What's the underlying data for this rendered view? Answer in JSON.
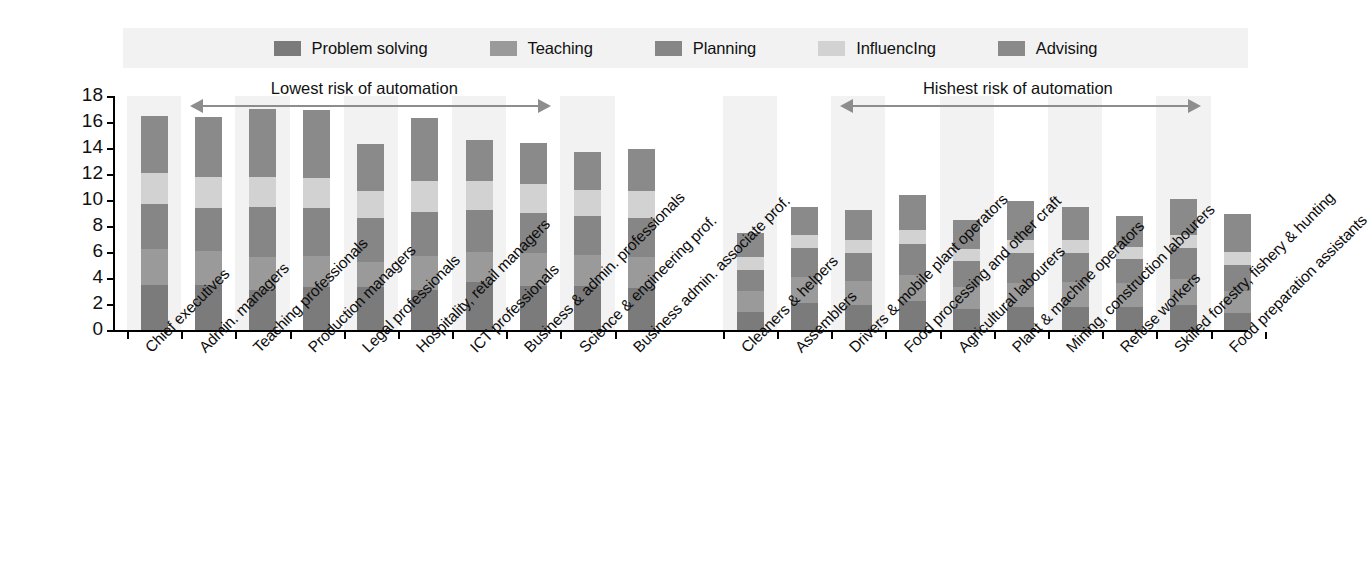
{
  "legend": {
    "items": [
      {
        "label": "Problem solving",
        "color": "#7b7b7b",
        "icon": "legend-swatch-icon"
      },
      {
        "label": "Teaching",
        "color": "#9a9a9a",
        "icon": "legend-swatch-icon"
      },
      {
        "label": "Planning",
        "color": "#868686",
        "icon": "legend-swatch-icon"
      },
      {
        "label": "InfluencIng",
        "color": "#d2d2d2",
        "icon": "legend-swatch-icon"
      },
      {
        "label": "Advising",
        "color": "#8a8a8a",
        "icon": "legend-swatch-icon"
      }
    ]
  },
  "annotations": {
    "left": {
      "text": "Lowest risk of automation"
    },
    "right": {
      "text": "Hishest risk of automation"
    }
  },
  "chart_data": {
    "type": "bar",
    "stacked": true,
    "title": "",
    "xlabel": "",
    "ylabel": "",
    "ylim": [
      0,
      18
    ],
    "ytick_labels": [
      "0",
      "2",
      "4",
      "6",
      "8",
      "10",
      "12",
      "14",
      "16",
      "18"
    ],
    "ytick_values": [
      0,
      2,
      4,
      6,
      8,
      10,
      12,
      14,
      16,
      18
    ],
    "grid": false,
    "legend_position": "top",
    "series": [
      {
        "name": "Problem solving",
        "color": "#7b7b7b",
        "values": [
          3.5,
          3.5,
          3.1,
          3.3,
          3.3,
          3.1,
          3.7,
          3.4,
          3.4,
          3.2,
          1.4,
          2.1,
          1.9,
          2.2,
          1.6,
          1.8,
          1.8,
          1.8,
          1.9,
          1.3
        ]
      },
      {
        "name": "Teaching",
        "color": "#9a9a9a",
        "values": [
          2.7,
          2.6,
          2.5,
          2.4,
          1.9,
          2.6,
          2.3,
          2.5,
          2.4,
          2.4,
          1.6,
          2.0,
          1.9,
          2.0,
          1.7,
          1.8,
          1.9,
          1.8,
          2.0,
          1.7
        ]
      },
      {
        "name": "Planning",
        "color": "#868686",
        "values": [
          3.5,
          3.3,
          3.9,
          3.7,
          3.4,
          3.4,
          3.2,
          3.1,
          3.0,
          3.0,
          1.6,
          2.2,
          2.1,
          2.4,
          2.0,
          2.3,
          2.2,
          1.9,
          2.4,
          2.0
        ]
      },
      {
        "name": "InfluencIng",
        "color": "#d2d2d2",
        "values": [
          2.4,
          2.4,
          2.3,
          2.3,
          2.1,
          2.4,
          2.3,
          2.2,
          2.0,
          2.1,
          1.0,
          1.0,
          1.0,
          1.1,
          0.9,
          1.0,
          1.0,
          0.9,
          1.0,
          1.0
        ]
      },
      {
        "name": "Advising",
        "color": "#8a8a8a",
        "values": [
          4.4,
          4.6,
          5.2,
          5.2,
          3.6,
          4.8,
          3.1,
          3.2,
          2.9,
          3.2,
          1.9,
          2.2,
          2.3,
          2.7,
          2.3,
          3.0,
          2.6,
          2.4,
          2.8,
          2.9
        ]
      },
      {
        "name": "__gap__",
        "color": "transparent",
        "values": [
          0,
          0,
          0,
          0,
          0,
          0,
          0,
          0,
          0,
          0,
          0,
          0,
          0,
          0,
          0,
          0,
          0,
          0,
          0,
          0
        ]
      }
    ],
    "totals": [
      16.5,
      16.4,
      17.0,
      16.9,
      14.3,
      16.3,
      14.6,
      14.4,
      13.7,
      13.9,
      7.5,
      9.5,
      9.2,
      10.4,
      8.5,
      9.9,
      9.5,
      8.8,
      10.1,
      8.9
    ],
    "categories": [
      "Chief executives",
      "Admin. managers",
      "Teaching professionals",
      "Production managers",
      "Legal professionals",
      "Hospitality, retail managers",
      "ICT professionals",
      "Business & admin. professionals",
      "Science & engineering prof.",
      "Business admin. associate prof.",
      "Cleaners & helpers",
      "Assemblers",
      "Drivers & mobile plant operators",
      "Food processing and other craft",
      "Agricultural labourers",
      "Plant & machine operators",
      "Mining, construction labourers",
      "Refuse workers",
      "Skilled forestry, fishery & hunting",
      "Food preparation assistants"
    ]
  }
}
